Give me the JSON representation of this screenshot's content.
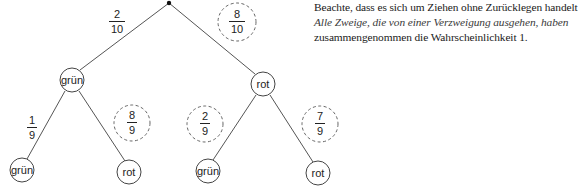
{
  "diagram": {
    "type": "probability-tree",
    "root": {
      "x": 169,
      "y": 3
    },
    "level1": [
      {
        "label": "grün",
        "x": 72,
        "y": 80,
        "r": 12,
        "branch_prob": {
          "num": "2",
          "den": "10",
          "x": 117,
          "y": 22,
          "circled": false
        }
      },
      {
        "label": "rot",
        "x": 263,
        "y": 84,
        "r": 12,
        "branch_prob": {
          "num": "8",
          "den": "10",
          "x": 237,
          "y": 22,
          "circled": true
        }
      }
    ],
    "level2": [
      {
        "parent": 0,
        "label": "grün",
        "x": 22,
        "y": 170,
        "r": 12,
        "branch_prob": {
          "num": "1",
          "den": "9",
          "x": 32,
          "y": 128,
          "circled": false
        }
      },
      {
        "parent": 0,
        "label": "rot",
        "x": 129,
        "y": 172,
        "r": 12,
        "branch_prob": {
          "num": "8",
          "den": "9",
          "x": 132,
          "y": 123,
          "circled": true
        }
      },
      {
        "parent": 1,
        "label": "grün",
        "x": 208,
        "y": 171,
        "r": 12,
        "branch_prob": {
          "num": "2",
          "den": "9",
          "x": 205,
          "y": 124,
          "circled": true
        }
      },
      {
        "parent": 1,
        "label": "rot",
        "x": 318,
        "y": 173,
        "r": 12,
        "branch_prob": {
          "num": "7",
          "den": "9",
          "x": 320,
          "y": 124,
          "circled": true
        }
      }
    ],
    "colors": {
      "line": "#555555",
      "node_stroke": "#444444",
      "dashed_circle": "#666666",
      "text": "#222222"
    }
  },
  "note": {
    "line1": "Beachte, dass es sich um Ziehen ohne Zurücklegen handelt.",
    "line2": "Alle Zweige, die von einer Verzweigung ausgehen, haben",
    "line3": "zusammengenommen die Wahrscheinlichkeit 1."
  }
}
